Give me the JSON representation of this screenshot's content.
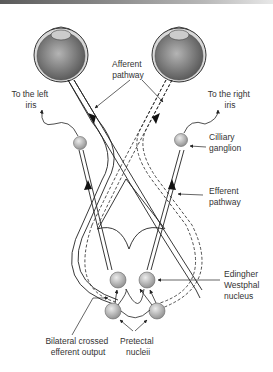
{
  "labels": {
    "afferent": [
      "Afferent",
      "pathway"
    ],
    "left_iris": [
      "To the left",
      "iris"
    ],
    "right_iris": [
      "To the right",
      "iris"
    ],
    "ciliary": [
      "Cilliary",
      "ganglion"
    ],
    "efferent": [
      "Efferent",
      "pathway"
    ],
    "ew": [
      "Edingher",
      "Westphal",
      "nucleus"
    ],
    "bilateral": [
      "Bilateral crossed",
      "efferent output"
    ],
    "pretectal": [
      "Pretectal",
      "nucleii"
    ]
  },
  "colors": {
    "line": "#222222",
    "nucleus_light": "#e6e6e6",
    "nucleus_dark": "#8a8a8a",
    "eye_light": "#b0b0b0",
    "eye_dark": "#5a5a5a"
  }
}
